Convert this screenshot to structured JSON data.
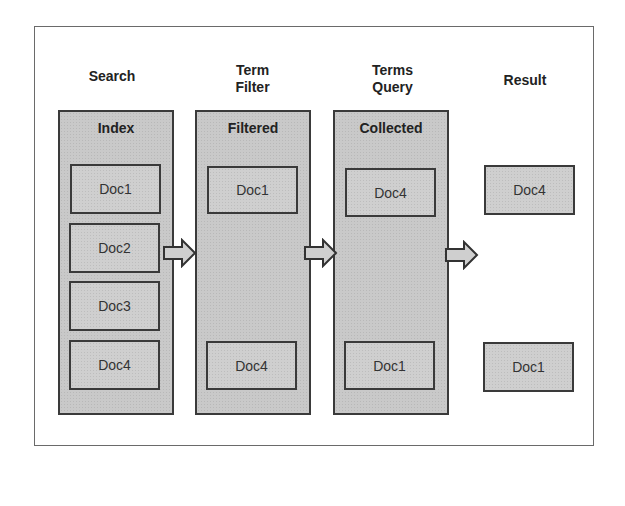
{
  "diagram": {
    "headings": {
      "search": "Search",
      "term_filter_line1": "Term",
      "term_filter_line2": "Filter",
      "terms_query_line1": "Terms",
      "terms_query_line2": "Query",
      "result": "Result"
    },
    "columns": {
      "index": {
        "title": "Index",
        "docs": [
          "Doc1",
          "Doc2",
          "Doc3",
          "Doc4"
        ]
      },
      "filtered": {
        "title": "Filtered",
        "docs": [
          "Doc1",
          "Doc4"
        ]
      },
      "collected": {
        "title": "Collected",
        "docs": [
          "Doc4",
          "Doc1"
        ]
      }
    },
    "result": {
      "docs": [
        "Doc4",
        "Doc1"
      ]
    },
    "colors": {
      "box_fill": "#c9c9c9",
      "border": "#3a3a3a",
      "text": "#222222"
    }
  }
}
